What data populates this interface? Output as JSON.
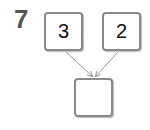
{
  "problem": {
    "number": "7",
    "left_box": "3",
    "right_box": "2",
    "result_box": ""
  },
  "colors": {
    "border": "#8a8a8a",
    "arrow": "#999999",
    "number": "#555555"
  }
}
